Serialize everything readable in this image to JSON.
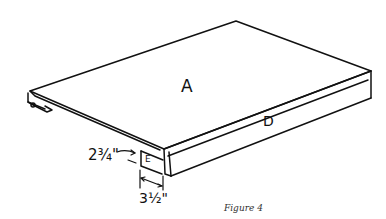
{
  "diagram": {
    "type": "isometric woodworking part drawing",
    "parts": {
      "top_panel": "A",
      "front_rail": "D",
      "end_block": "E"
    },
    "dimensions": {
      "height": "2¾\"",
      "width": "3½\""
    },
    "caption": "Figure 4"
  }
}
